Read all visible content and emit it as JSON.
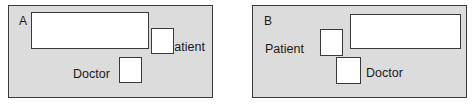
{
  "figure": {
    "background_color": "#ffffff",
    "panel_fill_color": "#dcdcdc",
    "box_fill_color": "#ffffff",
    "stroke_color": "#3a3a3a",
    "text_color": "#1a1a1a"
  },
  "panels": [
    {
      "id": "a",
      "letter": "A",
      "patient_label": "Patient",
      "doctor_label": "Doctor"
    },
    {
      "id": "b",
      "letter": "B",
      "patient_label": "Patient",
      "doctor_label": "Doctor"
    }
  ]
}
